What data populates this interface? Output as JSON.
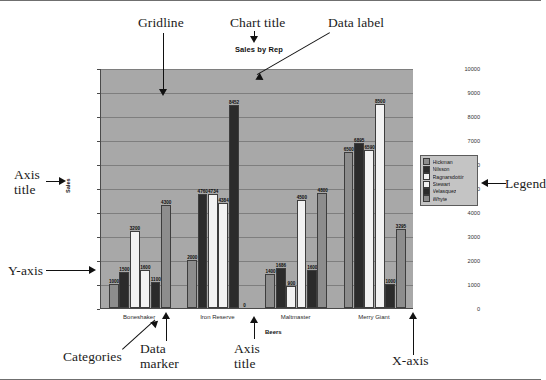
{
  "figure": {
    "annotations": [
      {
        "name": "gridline",
        "text": "Gridline"
      },
      {
        "name": "chart-title",
        "text": "Chart title"
      },
      {
        "name": "data-label",
        "text": "Data label"
      },
      {
        "name": "legend",
        "text": "Legend"
      },
      {
        "name": "axis-title-y",
        "text": "Axis\ntitle"
      },
      {
        "name": "y-axis",
        "text": "Y-axis"
      },
      {
        "name": "categories",
        "text": "Categories"
      },
      {
        "name": "data-marker",
        "text": "Data\nmarker"
      },
      {
        "name": "axis-title-x",
        "text": "Axis\ntitle"
      },
      {
        "name": "x-axis",
        "text": "X-axis"
      }
    ]
  },
  "chart_data": {
    "type": "bar",
    "title": "Sales by Rep",
    "xlabel": "Beers",
    "ylabel": "Sales",
    "ylim": [
      0,
      10000
    ],
    "ytick_values": [
      0,
      1000,
      2000,
      3000,
      4000,
      5000,
      6000,
      7000,
      8000,
      9000,
      10000
    ],
    "ytick_labels": [
      "0",
      "1000",
      "2000",
      "3000",
      "4000",
      "5000",
      "6000",
      "7000",
      "8000",
      "9000",
      "10000"
    ],
    "grid": true,
    "legend_position": "right",
    "categories": [
      "Boneshaker",
      "Iron Reserve",
      "Maltmaster",
      "Merry Giant"
    ],
    "series": [
      {
        "name": "Hickman",
        "color": "#8d8d8d",
        "values": [
          1000,
          2000,
          1400,
          6500
        ]
      },
      {
        "name": "Nilsson",
        "color": "#2b2b2b",
        "values": [
          1500,
          4760,
          1686,
          6895
        ]
      },
      {
        "name": "Ragnarsdottir",
        "color": "#f2f2f2",
        "values": [
          3200,
          4734,
          900,
          6590
        ]
      },
      {
        "name": "Stewart",
        "color": "#f2f2f2",
        "values": [
          1600,
          4384,
          4500,
          8500
        ]
      },
      {
        "name": "Velasquez",
        "color": "#2b2b2b",
        "values": [
          1100,
          8452,
          1600,
          1000
        ]
      },
      {
        "name": "Whyte",
        "color": "#8d8d8d",
        "values": [
          4300,
          0,
          4800,
          3295
        ]
      }
    ],
    "data_labels": [
      [
        "1000",
        "1500",
        "3200",
        "1600",
        "1100",
        "4300"
      ],
      [
        "2000",
        "4760",
        "4734",
        "4384",
        "8452",
        "0"
      ],
      [
        "1400",
        "1686",
        "900",
        "4500",
        "1600",
        "4800"
      ],
      [
        "6500",
        "6895",
        "6590",
        "8500",
        "1000",
        "3295"
      ]
    ]
  }
}
